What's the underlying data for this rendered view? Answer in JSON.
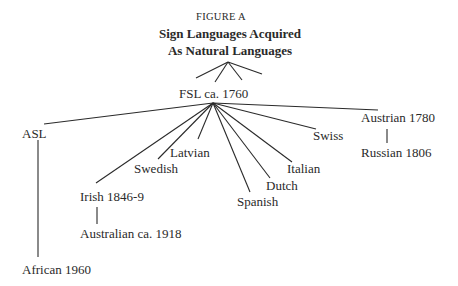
{
  "figure": {
    "label": "FIGURE A",
    "title_line1": "Sign Languages Acquired",
    "title_line2": "As Natural Languages"
  },
  "tree": {
    "root": "FSL ca. 1760",
    "children": [
      {
        "id": "asl",
        "label": "ASL",
        "children": [
          {
            "id": "african",
            "label": "African 1960"
          }
        ]
      },
      {
        "id": "irish",
        "label": "Irish 1846-9",
        "children": [
          {
            "id": "australian",
            "label": "Australian ca. 1918"
          }
        ]
      },
      {
        "id": "swedish",
        "label": "Swedish"
      },
      {
        "id": "latvian",
        "label": "Latvian"
      },
      {
        "id": "spanish",
        "label": "Spanish"
      },
      {
        "id": "dutch",
        "label": "Dutch"
      },
      {
        "id": "italian",
        "label": "Italian"
      },
      {
        "id": "swiss",
        "label": "Swiss"
      },
      {
        "id": "austrian",
        "label": "Austrian 1780",
        "children": [
          {
            "id": "russian",
            "label": "Russian 1806"
          }
        ]
      }
    ]
  }
}
